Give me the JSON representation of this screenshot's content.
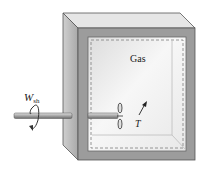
{
  "diagram": {
    "gas_label": "Gas",
    "work_label_main": "W",
    "work_label_sub": "sh",
    "temp_label": "T",
    "colors": {
      "box_front": "#9a9a9a",
      "box_side": "#b8b8b8",
      "box_top": "#e4e4e4",
      "interior": "#ececec",
      "dashed_boundary": "#8a8a8a",
      "shaft": "#b0b0b0",
      "ink": "#222222"
    }
  }
}
